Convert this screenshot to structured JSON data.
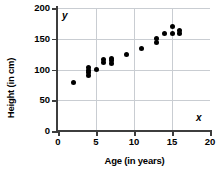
{
  "chart_data": {
    "type": "scatter",
    "title": "",
    "xlabel": "Age (in years)",
    "ylabel": "Height (in cm)",
    "x_axis_symbol": "x",
    "y_axis_symbol": "y",
    "xlim": [
      0,
      20
    ],
    "ylim": [
      0,
      200
    ],
    "xticks": [
      0,
      5,
      10,
      15,
      20
    ],
    "yticks": [
      0,
      50,
      100,
      150,
      200
    ],
    "xticklabels": [
      "0",
      "5",
      "10",
      "15",
      "20"
    ],
    "yticklabels": [
      "0",
      "50",
      "100",
      "150",
      "200"
    ],
    "grid": true,
    "legend": null,
    "marker": "filled-circle",
    "marker_color": "#000000",
    "points": [
      {
        "x": 2,
        "y": 79
      },
      {
        "x": 4,
        "y": 90
      },
      {
        "x": 4,
        "y": 95
      },
      {
        "x": 4,
        "y": 99
      },
      {
        "x": 4,
        "y": 103
      },
      {
        "x": 5,
        "y": 100
      },
      {
        "x": 6,
        "y": 111
      },
      {
        "x": 6,
        "y": 116
      },
      {
        "x": 7,
        "y": 110
      },
      {
        "x": 7,
        "y": 114
      },
      {
        "x": 7,
        "y": 118
      },
      {
        "x": 9,
        "y": 124
      },
      {
        "x": 11,
        "y": 134
      },
      {
        "x": 13,
        "y": 144
      },
      {
        "x": 13,
        "y": 150
      },
      {
        "x": 14,
        "y": 159
      },
      {
        "x": 15,
        "y": 159
      },
      {
        "x": 15,
        "y": 170
      },
      {
        "x": 16,
        "y": 158
      },
      {
        "x": 16,
        "y": 163
      }
    ]
  }
}
